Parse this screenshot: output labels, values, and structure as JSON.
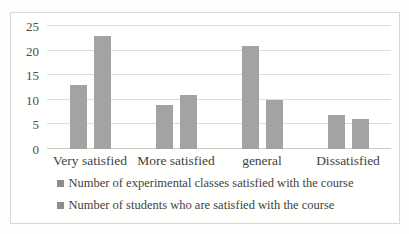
{
  "chart_data": {
    "type": "bar",
    "title": "",
    "categories": [
      "Very satisfied",
      "More satisfied",
      "general",
      "Dissatisfied"
    ],
    "series": [
      {
        "name": "Number of experimental classes satisfied with the course",
        "values": [
          13,
          9,
          21,
          7
        ]
      },
      {
        "name": "Number of students who are satisfied with the course",
        "values": [
          23,
          11,
          10,
          6
        ]
      }
    ],
    "xlabel": "",
    "ylabel": "",
    "ylim": [
      0,
      25
    ],
    "yticks": [
      0,
      5,
      10,
      15,
      20,
      25
    ],
    "grid": true,
    "legend_position": "bottom",
    "colors": {
      "bar_fill": "#a3a3a3",
      "legend_swatch": "#8c8c8c",
      "gridline": "#dcdcdc",
      "axis_line": "#c9c9c9",
      "text": "#3f3f3f",
      "frame_border": "#d8d8d8"
    }
  }
}
